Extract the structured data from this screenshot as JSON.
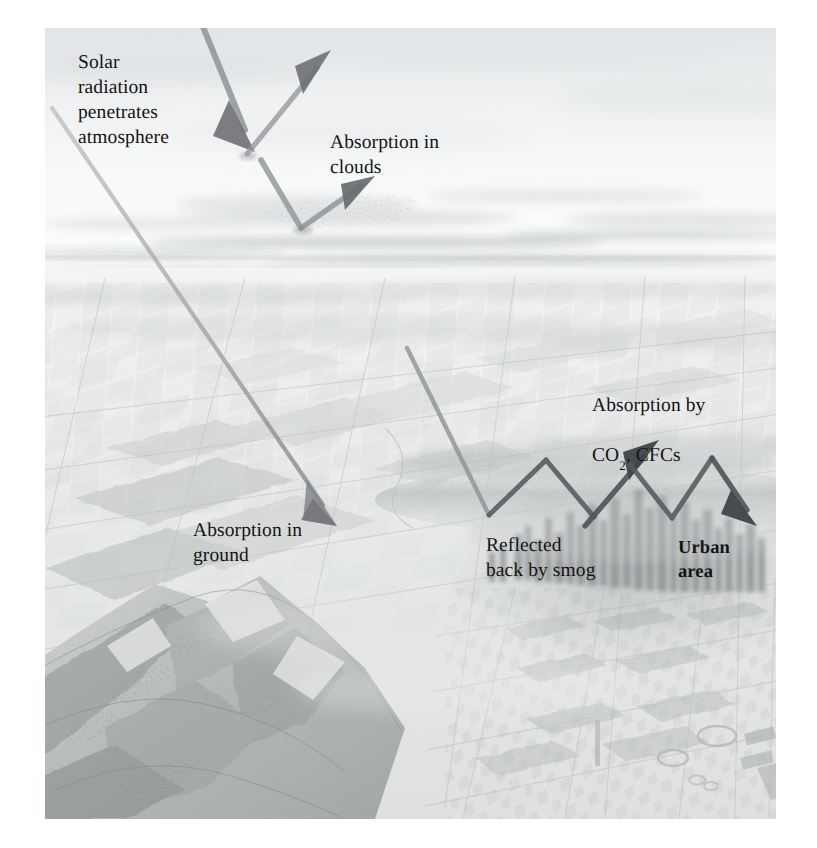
{
  "figure": {
    "kind": "scientific-illustration",
    "medium": "pencil-airbrush-aerial-landscape",
    "palette": {
      "page": "#ffffff",
      "plate_light": "#fdfdfd",
      "sky_haze": "#e8eaec",
      "horizon_band": "#d3d6d9",
      "farmland": "#dcdedd",
      "farmland_dark": "#c2c5c4",
      "mountain": "#b4b7b6",
      "mountain_dark": "#8e9291",
      "city": "#9da1a2",
      "smog": "#cfd2d3",
      "arrow_light": "#9a9c9e",
      "arrow_dark": "#5b5d60",
      "text": "#141414"
    }
  },
  "labels": [
    {
      "id": "solar-radiation",
      "text": "Solar\nradiation\npenetrates\natmosphere",
      "x": 78,
      "y": 50,
      "bold": false
    },
    {
      "id": "absorption-clouds",
      "text": "Absorption in\nclouds",
      "x": 330,
      "y": 130,
      "bold": false
    },
    {
      "id": "absorption-co2-cfcs",
      "text": "Absorption by",
      "x": 592,
      "y": 368,
      "bold": false
    },
    {
      "id": "absorption-co2-cfcs-line2",
      "text": "CO",
      "sub": "2",
      "tail": ", CFCs",
      "x": 592,
      "y": 392,
      "bold": false
    },
    {
      "id": "absorption-ground",
      "text": "Absorption in\nground",
      "x": 193,
      "y": 518,
      "bold": false
    },
    {
      "id": "reflected-smog",
      "text": "Reflected\nback by smog",
      "x": 486,
      "y": 533,
      "bold": false
    },
    {
      "id": "urban-area",
      "text": "Urban\narea",
      "x": 678,
      "y": 535,
      "bold": true
    }
  ],
  "rays": [
    {
      "id": "ray-incoming-cloud-top",
      "role": "solar radiation entering atmosphere, striking cloud top",
      "points": "[[200,4],[245,128]]",
      "arrowhead": "end-down",
      "tone": "mid"
    },
    {
      "id": "ray-reflected-cloud-top",
      "role": "reflected from cloud top back to space",
      "points": "[[245,128],[318,62]]",
      "arrowhead": "end-up",
      "tone": "mid"
    },
    {
      "id": "ray-incoming-cloud-low",
      "role": "solar radiation entering atmosphere, striking lower cloud deck",
      "points": "[[262,140],[300,228]]",
      "arrowhead": "none",
      "tone": "mid"
    },
    {
      "id": "ray-absorption-clouds-up",
      "role": "absorption in clouds, re-radiated upward",
      "points": "[[300,228],[341,196]]",
      "arrowhead": "end-up",
      "tone": "mid"
    },
    {
      "id": "ray-long-diagonal-ground",
      "role": "solar radiation penetrating to the ground surface",
      "points": "[[52,108],[325,505]]",
      "arrowhead": "end-down",
      "tone": "light"
    },
    {
      "id": "ray-to-smog-1",
      "role": "solar radiation descending into smog layer above city",
      "points": "[[414,358],[489,513]]",
      "arrowhead": "none",
      "tone": "mid"
    },
    {
      "id": "ray-smog-bounce-up-1",
      "role": "reflected back by smog, first upward bounce",
      "points": "[[489,513],[546,460]]",
      "arrowhead": "none",
      "tone": "dark"
    },
    {
      "id": "ray-smog-bounce-down-1",
      "role": "smog bounce descending",
      "points": "[[546,460],[594,517]]",
      "arrowhead": "none",
      "tone": "dark"
    },
    {
      "id": "ray-absorption-co2-up",
      "role": "absorption by CO2 and CFCs, upward re-radiation",
      "points": "[[594,517],[645,452]]",
      "arrowhead": "end-up",
      "tone": "dark"
    },
    {
      "id": "ray-co2-down",
      "role": "downward re-radiation toward urban area",
      "points": "[[628,463],[672,516]]",
      "arrowhead": "none",
      "tone": "dark"
    },
    {
      "id": "ray-urban-up",
      "role": "upward leg above urban area",
      "points": "[[672,516],[712,457]]",
      "arrowhead": "none",
      "tone": "dark"
    },
    {
      "id": "ray-urban-down-final",
      "role": "trapped heat returning to urban area",
      "points": "[[712,457],[750,510]]",
      "arrowhead": "end-down",
      "tone": "dark"
    }
  ],
  "scene": {
    "sky": {
      "label": "hazy upper atmosphere",
      "top": 0,
      "bottom": 210
    },
    "horizon": {
      "label": "distant horizon haze band",
      "y": 232
    },
    "farmland": {
      "label": "patchwork agricultural fields in perspective",
      "top": 250,
      "bottom": 640
    },
    "mountains": {
      "label": "mountain ridge with valleys, lower left",
      "top": 545,
      "bottom": 791
    },
    "city": {
      "label": "urban skyline and industrial sprawl",
      "left": 430,
      "top": 455,
      "bottom": 791
    },
    "smog_layer": {
      "label": "smog haze band over urban area",
      "y": 470
    }
  }
}
